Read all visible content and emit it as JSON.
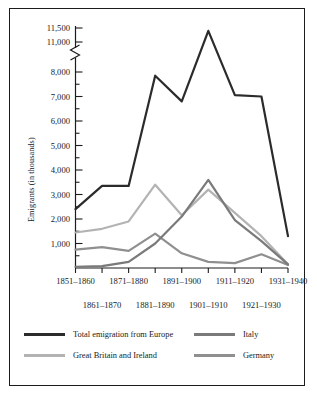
{
  "chart_data": {
    "type": "line",
    "title": "",
    "xlabel": "",
    "ylabel": "Emigrants (in thousands)",
    "categories": [
      "1851–1860",
      "1861–1870",
      "1871–1880",
      "1881–1890",
      "1891–1900",
      "1901–1910",
      "1911–1920",
      "1921–1930",
      "1931–1940"
    ],
    "xticks_upper": [
      "1851–1860",
      "1871–1880",
      "1891–1900",
      "1911–1920",
      "1931–1940"
    ],
    "xticks_lower": [
      "1861–1870",
      "1881–1890",
      "1901–1910",
      "1921–1930"
    ],
    "yticks": [
      "1,000",
      "2,000",
      "3,000",
      "4,000",
      "5,000",
      "6,000",
      "7,000",
      "8,000",
      "11,000",
      "11,500"
    ],
    "ylim": [
      0,
      11500
    ],
    "axis_break": true,
    "axis_break_between": [
      8000,
      11000
    ],
    "minor_tick_interval": 500,
    "grid": false,
    "legend_position": "bottom",
    "series": [
      {
        "name": "Total emigration from Europe",
        "color": "#2b2b2b",
        "values": [
          2400,
          3350,
          3350,
          7850,
          6800,
          11400,
          9100,
          7000,
          1300
        ]
      },
      {
        "name": "Great Britain and Ireland",
        "color": "#b3b3b3",
        "values": [
          1450,
          1600,
          1900,
          3400,
          2150,
          3200,
          2250,
          1300,
          150
        ]
      },
      {
        "name": "Italy",
        "color": "#7a7a7a",
        "values": [
          50,
          80,
          250,
          1000,
          2100,
          3600,
          1950,
          1100,
          150
        ]
      },
      {
        "name": "Germany",
        "color": "#8f8f8f",
        "values": [
          750,
          850,
          700,
          1400,
          600,
          250,
          200,
          560,
          120
        ]
      }
    ]
  },
  "legend": {
    "entries": [
      {
        "label": "Total emigration from Europe",
        "color": "#2b2b2b"
      },
      {
        "label": "Italy",
        "color": "#7a7a7a"
      },
      {
        "label": "Great Britain and Ireland",
        "color": "#b3b3b3"
      },
      {
        "label": "Germany",
        "color": "#8f8f8f"
      }
    ]
  }
}
